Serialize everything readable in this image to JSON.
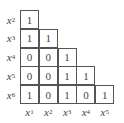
{
  "matrix": {
    "row_labels": [
      {
        "var": "x",
        "sub": "2"
      },
      {
        "var": "x",
        "sub": "3"
      },
      {
        "var": "x",
        "sub": "4"
      },
      {
        "var": "x",
        "sub": "5"
      },
      {
        "var": "x",
        "sub": "6"
      }
    ],
    "col_labels": [
      {
        "var": "x",
        "sub": "1"
      },
      {
        "var": "x",
        "sub": "2"
      },
      {
        "var": "x",
        "sub": "3"
      },
      {
        "var": "x",
        "sub": "4"
      },
      {
        "var": "x",
        "sub": "5"
      }
    ],
    "rows": [
      [
        "1"
      ],
      [
        "1",
        "1"
      ],
      [
        "0",
        "0",
        "1"
      ],
      [
        "0",
        "0",
        "1",
        "1"
      ],
      [
        "1",
        "0",
        "1",
        "0",
        "1"
      ]
    ]
  }
}
